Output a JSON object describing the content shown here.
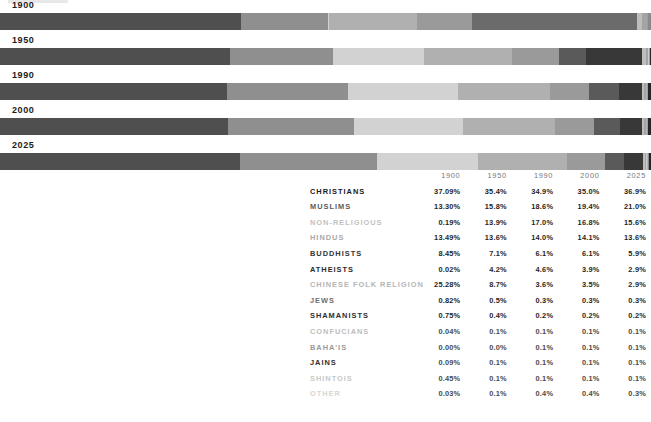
{
  "chart_data": {
    "type": "bar",
    "title": "",
    "subtitle": "",
    "xlabel": "",
    "ylabel": "",
    "orientation": "horizontal-stacked-100",
    "grid": false,
    "legend_position": "none",
    "categories": [
      "1900",
      "1950",
      "1990",
      "2000",
      "2025"
    ],
    "series": [
      {
        "name": "CHRISTIANS",
        "values": [
          37.09,
          35.4,
          34.9,
          35.0,
          36.9
        ],
        "color": "#4f4f4f"
      },
      {
        "name": "MUSLIMS",
        "values": [
          13.3,
          15.8,
          18.6,
          19.4,
          21.0
        ],
        "color": "#8a8a8a"
      },
      {
        "name": "NON-RELIGIOUS",
        "values": [
          0.19,
          13.9,
          17.0,
          16.8,
          15.6
        ],
        "color": "#cfcfcf"
      },
      {
        "name": "HINDUS",
        "values": [
          13.49,
          13.6,
          14.0,
          14.1,
          13.6
        ],
        "color": "#a6a6a6"
      },
      {
        "name": "BUDDHISTS",
        "values": [
          8.45,
          7.1,
          6.1,
          6.1,
          5.9
        ],
        "color": "#8f8f8f"
      },
      {
        "name": "ATHEISTS",
        "values": [
          0.02,
          4.2,
          4.6,
          3.9,
          2.9
        ],
        "color": "#5a5a5a"
      },
      {
        "name": "CHINESE FOLK RELIGION",
        "values": [
          25.28,
          8.7,
          3.6,
          3.5,
          2.9
        ],
        "color": "#383838"
      },
      {
        "name": "JEWS",
        "values": [
          0.82,
          0.5,
          0.3,
          0.3,
          0.3
        ],
        "color": "#b9b9b9"
      },
      {
        "name": "SHAMANISTS",
        "values": [
          0.75,
          0.4,
          0.2,
          0.2,
          0.2
        ],
        "color": "#9d9d9d"
      },
      {
        "name": "CONFUCIANS",
        "values": [
          0.04,
          0.1,
          0.1,
          0.1,
          0.1
        ],
        "color": "#cccccc"
      },
      {
        "name": "BAHA'IS",
        "values": [
          0.0,
          0.0,
          0.1,
          0.1,
          0.1
        ],
        "color": "#b0b0b0"
      },
      {
        "name": "JAINS",
        "values": [
          0.09,
          0.1,
          0.1,
          0.1,
          0.1
        ],
        "color": "#9a9a9a"
      },
      {
        "name": "SHINTOIS",
        "values": [
          0.45,
          0.1,
          0.1,
          0.1,
          0.1
        ],
        "color": "#8c8c8c"
      },
      {
        "name": "OTHER",
        "values": [
          0.03,
          0.1,
          0.4,
          0.4,
          0.3
        ],
        "color": "#2a2a2a"
      }
    ]
  },
  "bars": {
    "rows": [
      {
        "year": "1900",
        "segments": [
          {
            "name": "CHRISTIANS",
            "pct": 37.09,
            "color": "#4f4f4f"
          },
          {
            "name": "MUSLIMS",
            "pct": 13.3,
            "color": "#8f8f8f"
          },
          {
            "name": "NON-RELIGIOUS",
            "pct": 0.19,
            "color": "#d2d2d2"
          },
          {
            "name": "HINDUS",
            "pct": 13.49,
            "color": "#b0b0b0"
          },
          {
            "name": "BUDDHISTS",
            "pct": 8.45,
            "color": "#9a9a9a"
          },
          {
            "name": "ATHEISTS",
            "pct": 0.02,
            "color": "#5a5a5a"
          },
          {
            "name": "CHINESE FOLK RELIGION",
            "pct": 25.28,
            "color": "#6b6b6b"
          },
          {
            "name": "JEWS",
            "pct": 0.82,
            "color": "#bdbdbd"
          },
          {
            "name": "SHAMANISTS",
            "pct": 0.75,
            "color": "#a4a4a4"
          },
          {
            "name": "CONFUCIANS",
            "pct": 0.04,
            "color": "#cccccc"
          },
          {
            "name": "BAHA'IS",
            "pct": 0.0,
            "color": "#b4b4b4"
          },
          {
            "name": "JAINS",
            "pct": 0.09,
            "color": "#9e9e9e"
          },
          {
            "name": "SHINTOIS",
            "pct": 0.45,
            "color": "#8a8a8a"
          },
          {
            "name": "OTHER",
            "pct": 0.03,
            "color": "#262626"
          }
        ]
      },
      {
        "year": "1950",
        "segments": [
          {
            "name": "CHRISTIANS",
            "pct": 35.4,
            "color": "#4f4f4f"
          },
          {
            "name": "MUSLIMS",
            "pct": 15.8,
            "color": "#8f8f8f"
          },
          {
            "name": "NON-RELIGIOUS",
            "pct": 13.9,
            "color": "#d2d2d2"
          },
          {
            "name": "HINDUS",
            "pct": 13.6,
            "color": "#b0b0b0"
          },
          {
            "name": "BUDDHISTS",
            "pct": 7.1,
            "color": "#9a9a9a"
          },
          {
            "name": "ATHEISTS",
            "pct": 4.2,
            "color": "#5a5a5a"
          },
          {
            "name": "CHINESE FOLK RELIGION",
            "pct": 8.7,
            "color": "#383838"
          },
          {
            "name": "JEWS",
            "pct": 0.5,
            "color": "#bdbdbd"
          },
          {
            "name": "SHAMANISTS",
            "pct": 0.4,
            "color": "#a4a4a4"
          },
          {
            "name": "CONFUCIANS",
            "pct": 0.1,
            "color": "#cccccc"
          },
          {
            "name": "BAHA'IS",
            "pct": 0.0,
            "color": "#b4b4b4"
          },
          {
            "name": "JAINS",
            "pct": 0.1,
            "color": "#9e9e9e"
          },
          {
            "name": "SHINTOIS",
            "pct": 0.1,
            "color": "#8a8a8a"
          },
          {
            "name": "OTHER",
            "pct": 0.1,
            "color": "#262626"
          }
        ]
      },
      {
        "year": "1990",
        "segments": [
          {
            "name": "CHRISTIANS",
            "pct": 34.9,
            "color": "#4f4f4f"
          },
          {
            "name": "MUSLIMS",
            "pct": 18.6,
            "color": "#8f8f8f"
          },
          {
            "name": "NON-RELIGIOUS",
            "pct": 17.0,
            "color": "#d2d2d2"
          },
          {
            "name": "HINDUS",
            "pct": 14.0,
            "color": "#b0b0b0"
          },
          {
            "name": "BUDDHISTS",
            "pct": 6.1,
            "color": "#9a9a9a"
          },
          {
            "name": "ATHEISTS",
            "pct": 4.6,
            "color": "#5a5a5a"
          },
          {
            "name": "CHINESE FOLK RELIGION",
            "pct": 3.6,
            "color": "#383838"
          },
          {
            "name": "JEWS",
            "pct": 0.3,
            "color": "#bdbdbd"
          },
          {
            "name": "SHAMANISTS",
            "pct": 0.2,
            "color": "#a4a4a4"
          },
          {
            "name": "CONFUCIANS",
            "pct": 0.1,
            "color": "#cccccc"
          },
          {
            "name": "BAHA'IS",
            "pct": 0.1,
            "color": "#b4b4b4"
          },
          {
            "name": "JAINS",
            "pct": 0.1,
            "color": "#9e9e9e"
          },
          {
            "name": "SHINTOIS",
            "pct": 0.1,
            "color": "#8a8a8a"
          },
          {
            "name": "OTHER",
            "pct": 0.4,
            "color": "#262626"
          }
        ]
      },
      {
        "year": "2000",
        "segments": [
          {
            "name": "CHRISTIANS",
            "pct": 35.0,
            "color": "#4f4f4f"
          },
          {
            "name": "MUSLIMS",
            "pct": 19.4,
            "color": "#8f8f8f"
          },
          {
            "name": "NON-RELIGIOUS",
            "pct": 16.8,
            "color": "#d2d2d2"
          },
          {
            "name": "HINDUS",
            "pct": 14.1,
            "color": "#b0b0b0"
          },
          {
            "name": "BUDDHISTS",
            "pct": 6.1,
            "color": "#9a9a9a"
          },
          {
            "name": "ATHEISTS",
            "pct": 3.9,
            "color": "#5a5a5a"
          },
          {
            "name": "CHINESE FOLK RELIGION",
            "pct": 3.5,
            "color": "#383838"
          },
          {
            "name": "JEWS",
            "pct": 0.3,
            "color": "#bdbdbd"
          },
          {
            "name": "SHAMANISTS",
            "pct": 0.2,
            "color": "#a4a4a4"
          },
          {
            "name": "CONFUCIANS",
            "pct": 0.1,
            "color": "#cccccc"
          },
          {
            "name": "BAHA'IS",
            "pct": 0.1,
            "color": "#b4b4b4"
          },
          {
            "name": "JAINS",
            "pct": 0.1,
            "color": "#9e9e9e"
          },
          {
            "name": "SHINTOIS",
            "pct": 0.1,
            "color": "#8a8a8a"
          },
          {
            "name": "OTHER",
            "pct": 0.4,
            "color": "#262626"
          }
        ]
      },
      {
        "year": "2025",
        "segments": [
          {
            "name": "CHRISTIANS",
            "pct": 36.9,
            "color": "#4f4f4f"
          },
          {
            "name": "MUSLIMS",
            "pct": 21.0,
            "color": "#8f8f8f"
          },
          {
            "name": "NON-RELIGIOUS",
            "pct": 15.6,
            "color": "#d2d2d2"
          },
          {
            "name": "HINDUS",
            "pct": 13.6,
            "color": "#b0b0b0"
          },
          {
            "name": "BUDDHISTS",
            "pct": 5.9,
            "color": "#9a9a9a"
          },
          {
            "name": "ATHEISTS",
            "pct": 2.9,
            "color": "#5a5a5a"
          },
          {
            "name": "CHINESE FOLK RELIGION",
            "pct": 2.9,
            "color": "#383838"
          },
          {
            "name": "JEWS",
            "pct": 0.3,
            "color": "#bdbdbd"
          },
          {
            "name": "SHAMANISTS",
            "pct": 0.2,
            "color": "#a4a4a4"
          },
          {
            "name": "CONFUCIANS",
            "pct": 0.1,
            "color": "#cccccc"
          },
          {
            "name": "BAHA'IS",
            "pct": 0.1,
            "color": "#b4b4b4"
          },
          {
            "name": "JAINS",
            "pct": 0.1,
            "color": "#9e9e9e"
          },
          {
            "name": "SHINTOIS",
            "pct": 0.1,
            "color": "#8a8a8a"
          },
          {
            "name": "OTHER",
            "pct": 0.3,
            "color": "#262626"
          }
        ]
      }
    ]
  },
  "table": {
    "label_header": "",
    "year_headers": [
      "1900",
      "1950",
      "1990",
      "2000",
      "2025"
    ],
    "rows": [
      {
        "label": "CHRISTIANS",
        "tone": "t0",
        "values": [
          "37.09%",
          "35.4%",
          "34.9%",
          "35.0%",
          "36.9%"
        ],
        "vtone": "vdark"
      },
      {
        "label": "MUSLIMS",
        "tone": "t1",
        "values": [
          "13.30%",
          "15.8%",
          "18.6%",
          "19.4%",
          "21.0%"
        ],
        "vtone": "vdark"
      },
      {
        "label": "NON-RELIGIOUS",
        "tone": "t2",
        "values": [
          "0.19%",
          "13.9%",
          "17.0%",
          "16.8%",
          "15.6%"
        ],
        "vtone": "vdark"
      },
      {
        "label": "HINDUS",
        "tone": "t3",
        "values": [
          "13.49%",
          "13.6%",
          "14.0%",
          "14.1%",
          "13.6%"
        ],
        "vtone": "vdark"
      },
      {
        "label": "BUDDHISTS",
        "tone": "t4",
        "values": [
          "8.45%",
          "7.1%",
          "6.1%",
          "6.1%",
          "5.9%"
        ],
        "vtone": "vdark"
      },
      {
        "label": "ATHEISTS",
        "tone": "t5",
        "values": [
          "0.02%",
          "4.2%",
          "4.6%",
          "3.9%",
          "2.9%"
        ],
        "vtone": "vdark"
      },
      {
        "label": "CHINESE FOLK RELIGION",
        "tone": "t6",
        "values": [
          "25.28%",
          "8.7%",
          "3.6%",
          "3.5%",
          "2.9%"
        ],
        "vtone": "vdark"
      },
      {
        "label": "JEWS",
        "tone": "t7",
        "values": [
          "0.82%",
          "0.5%",
          "0.3%",
          "0.3%",
          "0.3%"
        ],
        "vtone": "vdark"
      },
      {
        "label": "SHAMANISTS",
        "tone": "t8",
        "values": [
          "0.75%",
          "0.4%",
          "0.2%",
          "0.2%",
          "0.2%"
        ],
        "vtone": "vdark"
      },
      {
        "label": "CONFUCIANS",
        "tone": "t9",
        "values": [
          "0.04%",
          "0.1%",
          "0.1%",
          "0.1%",
          "0.1%"
        ],
        "vtone": "vmid"
      },
      {
        "label": "BAHA'IS",
        "tone": "t10",
        "values": [
          "0.00%",
          "0.0%",
          "0.1%",
          "0.1%",
          "0.1%"
        ],
        "vtone": "vmid"
      },
      {
        "label": "JAINS",
        "tone": "t11",
        "values": [
          "0.09%",
          "0.1%",
          "0.1%",
          "0.1%",
          "0.1%"
        ],
        "vtone": "vmid"
      },
      {
        "label": "SHINTOIS",
        "tone": "t12",
        "values": [
          "0.45%",
          "0.1%",
          "0.1%",
          "0.1%",
          "0.1%"
        ],
        "vtone": "vmid"
      },
      {
        "label": "OTHER",
        "tone": "t13",
        "values": [
          "0.03%",
          "0.1%",
          "0.4%",
          "0.4%",
          "0.3%"
        ],
        "vtone": "vmid"
      }
    ]
  }
}
